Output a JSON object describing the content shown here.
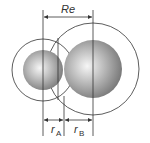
{
  "diagram": {
    "labels": {
      "re": "Re",
      "ra_main": "r",
      "ra_sub": "A",
      "rb_main": "r",
      "rb_sub": "B"
    },
    "atoms": [
      {
        "name": "A",
        "cx": 43,
        "cy": 70,
        "sphere_r": 20,
        "outer_r": 31
      },
      {
        "name": "B",
        "cx": 93,
        "cy": 69,
        "sphere_r": 29,
        "outer_r": 46
      }
    ],
    "colors": {
      "line": "#333333",
      "sphere_light": "#f4f4f4",
      "sphere_dark": "#7a7a7a"
    }
  }
}
